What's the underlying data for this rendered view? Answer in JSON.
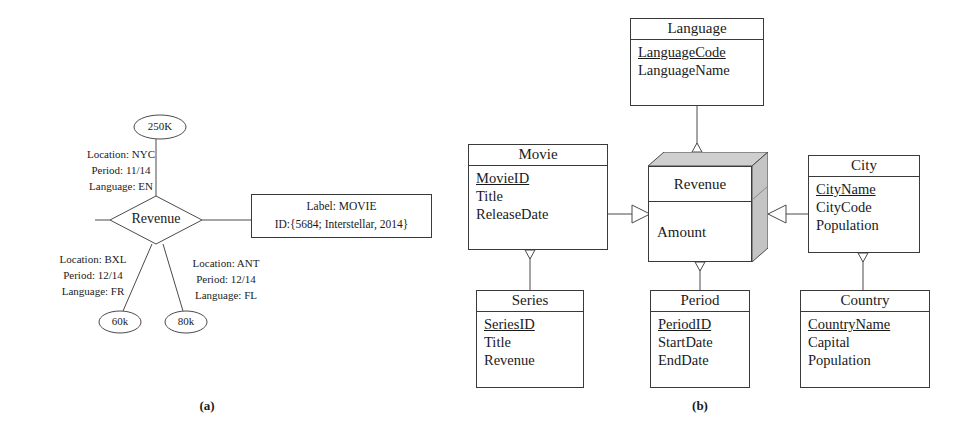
{
  "figure": {
    "caption_a": "(a)",
    "caption_b": "(b)"
  },
  "diagram_a": {
    "name": "revenue-hypernode-instance",
    "relationship": {
      "label": "Revenue"
    },
    "label_box": {
      "line1": "Label: MOVIE",
      "line2": "ID:{5684; Interstellar, 2014}"
    },
    "values": [
      {
        "id": "value-250k",
        "text": "250K"
      },
      {
        "id": "value-60k",
        "text": "60k"
      },
      {
        "id": "value-80k",
        "text": "80k"
      }
    ],
    "annotations": [
      {
        "id": "annotation-nyc",
        "lines": [
          "Location: NYC",
          "Period: 11/14",
          "Language: EN"
        ]
      },
      {
        "id": "annotation-bxl",
        "lines": [
          "Location: BXL",
          "Period: 12/14",
          "Language: FR"
        ]
      },
      {
        "id": "annotation-ant",
        "lines": [
          "Location: ANT",
          "Period: 12/14",
          "Language: FL"
        ]
      }
    ]
  },
  "diagram_b": {
    "name": "revenue-schema-er-diagram",
    "entities": [
      {
        "id": "entity-language",
        "title": "Language",
        "attributes": [
          {
            "name": "LanguageCode",
            "key": true
          },
          {
            "name": "LanguageName",
            "key": false
          }
        ]
      },
      {
        "id": "entity-movie",
        "title": "Movie",
        "attributes": [
          {
            "name": "MovieID",
            "key": true
          },
          {
            "name": "Title",
            "key": false
          },
          {
            "name": "ReleaseDate",
            "key": false
          }
        ]
      },
      {
        "id": "entity-city",
        "title": "City",
        "attributes": [
          {
            "name": "CityName",
            "key": true
          },
          {
            "name": "CityCode",
            "key": false
          },
          {
            "name": "Population",
            "key": false
          }
        ]
      },
      {
        "id": "entity-series",
        "title": "Series",
        "attributes": [
          {
            "name": "SeriesID",
            "key": true
          },
          {
            "name": "Title",
            "key": false
          },
          {
            "name": "Revenue",
            "key": false
          }
        ]
      },
      {
        "id": "entity-period",
        "title": "Period",
        "attributes": [
          {
            "name": "PeriodID",
            "key": true
          },
          {
            "name": "StartDate",
            "key": false
          },
          {
            "name": "EndDate",
            "key": false
          }
        ]
      },
      {
        "id": "entity-country",
        "title": "Country",
        "attributes": [
          {
            "name": "CountryName",
            "key": true
          },
          {
            "name": "Capital",
            "key": false
          },
          {
            "name": "Population",
            "key": false
          }
        ]
      }
    ],
    "cube_entity": {
      "id": "entity-revenue-cube",
      "title": "Revenue",
      "measure": "Amount"
    }
  },
  "colors": {
    "stroke": "#3a3a3a",
    "text": "#1a1a1a",
    "cube_shade": "#cfcfcf",
    "cube_shade_dark": "#bdbdbd",
    "background": "#ffffff"
  }
}
